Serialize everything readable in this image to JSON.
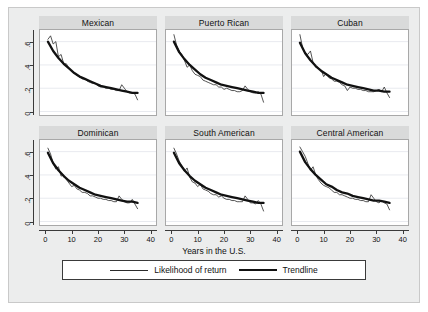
{
  "chart_data": {
    "type": "line",
    "title": "",
    "xlabel": "Years in the U.S.",
    "ylabel": "",
    "xlim": [
      -2,
      42
    ],
    "ylim": [
      -0.03,
      0.7
    ],
    "xticks": [
      "0",
      "10",
      "20",
      "30",
      "40"
    ],
    "xtick_values": [
      0,
      10,
      20,
      30,
      40
    ],
    "yticks": [
      "0",
      ".2",
      ".4",
      ".6"
    ],
    "ytick_values": [
      0,
      0.2,
      0.4,
      0.6
    ],
    "grid": "horizontal",
    "legend_position": "bottom",
    "legend": [
      {
        "name": "Likelihood of return",
        "style": "thin-line"
      },
      {
        "name": "Trendline",
        "style": "thick-line"
      }
    ],
    "layout": {
      "rows": 2,
      "cols": 3
    },
    "panels": [
      {
        "title": "Mexican",
        "row": 0,
        "col": 0,
        "series": [
          {
            "name": "Likelihood of return",
            "style": "thin-line",
            "x": [
              1,
              2,
              3,
              4,
              5,
              6,
              7,
              8,
              9,
              10,
              11,
              12,
              13,
              14,
              15,
              16,
              17,
              18,
              19,
              20,
              21,
              22,
              23,
              24,
              25,
              26,
              27,
              28,
              29,
              30,
              31,
              32,
              33,
              34,
              35
            ],
            "values": [
              0.62,
              0.65,
              0.58,
              0.6,
              0.47,
              0.49,
              0.41,
              0.41,
              0.37,
              0.35,
              0.33,
              0.31,
              0.3,
              0.28,
              0.28,
              0.26,
              0.25,
              0.24,
              0.24,
              0.22,
              0.21,
              0.21,
              0.2,
              0.2,
              0.19,
              0.19,
              0.18,
              0.18,
              0.23,
              0.2,
              0.17,
              0.16,
              0.16,
              0.15,
              0.1
            ]
          },
          {
            "name": "Trendline",
            "style": "thick-line",
            "x": [
              1,
              3,
              5,
              7,
              9,
              11,
              13,
              15,
              17,
              19,
              21,
              23,
              25,
              27,
              29,
              31,
              33,
              35
            ],
            "values": [
              0.6,
              0.52,
              0.46,
              0.41,
              0.37,
              0.33,
              0.3,
              0.28,
              0.26,
              0.24,
              0.22,
              0.21,
              0.2,
              0.19,
              0.18,
              0.17,
              0.16,
              0.16
            ]
          }
        ]
      },
      {
        "title": "Puerto Rican",
        "row": 0,
        "col": 1,
        "series": [
          {
            "name": "Likelihood of return",
            "style": "thin-line",
            "x": [
              1,
              2,
              3,
              4,
              5,
              6,
              7,
              8,
              9,
              10,
              11,
              12,
              13,
              14,
              15,
              16,
              17,
              18,
              19,
              20,
              21,
              22,
              23,
              24,
              25,
              26,
              27,
              28,
              29,
              30,
              31,
              32,
              33,
              34,
              35
            ],
            "values": [
              0.66,
              0.57,
              0.52,
              0.49,
              0.44,
              0.38,
              0.4,
              0.35,
              0.32,
              0.31,
              0.3,
              0.27,
              0.26,
              0.25,
              0.24,
              0.23,
              0.23,
              0.21,
              0.21,
              0.19,
              0.2,
              0.19,
              0.18,
              0.18,
              0.17,
              0.17,
              0.18,
              0.22,
              0.19,
              0.17,
              0.16,
              0.16,
              0.17,
              0.15,
              0.08
            ]
          },
          {
            "name": "Trendline",
            "style": "thick-line",
            "x": [
              1,
              3,
              5,
              7,
              9,
              11,
              13,
              15,
              17,
              19,
              21,
              23,
              25,
              27,
              29,
              31,
              33,
              35
            ],
            "values": [
              0.6,
              0.51,
              0.45,
              0.4,
              0.36,
              0.32,
              0.29,
              0.27,
              0.25,
              0.23,
              0.22,
              0.21,
              0.2,
              0.19,
              0.18,
              0.17,
              0.16,
              0.16
            ]
          }
        ]
      },
      {
        "title": "Cuban",
        "row": 0,
        "col": 2,
        "series": [
          {
            "name": "Likelihood of return",
            "style": "thin-line",
            "x": [
              1,
              2,
              3,
              4,
              5,
              6,
              7,
              8,
              9,
              10,
              11,
              12,
              13,
              14,
              15,
              16,
              17,
              18,
              19,
              20,
              21,
              22,
              23,
              24,
              25,
              26,
              27,
              28,
              29,
              30,
              31,
              32,
              33,
              34,
              35
            ],
            "values": [
              0.66,
              0.55,
              0.5,
              0.49,
              0.52,
              0.42,
              0.38,
              0.37,
              0.36,
              0.3,
              0.33,
              0.29,
              0.28,
              0.26,
              0.26,
              0.25,
              0.23,
              0.22,
              0.18,
              0.21,
              0.2,
              0.2,
              0.19,
              0.19,
              0.18,
              0.18,
              0.17,
              0.17,
              0.17,
              0.18,
              0.19,
              0.17,
              0.21,
              0.16,
              0.12
            ]
          },
          {
            "name": "Trendline",
            "style": "thick-line",
            "x": [
              1,
              3,
              5,
              7,
              9,
              11,
              13,
              15,
              17,
              19,
              21,
              23,
              25,
              27,
              29,
              31,
              33,
              35
            ],
            "values": [
              0.59,
              0.5,
              0.44,
              0.39,
              0.35,
              0.32,
              0.29,
              0.27,
              0.25,
              0.23,
              0.22,
              0.21,
              0.2,
              0.19,
              0.18,
              0.18,
              0.17,
              0.17
            ]
          }
        ]
      },
      {
        "title": "Dominican",
        "row": 1,
        "col": 0,
        "series": [
          {
            "name": "Likelihood of return",
            "style": "thin-line",
            "x": [
              1,
              2,
              3,
              4,
              5,
              6,
              7,
              8,
              9,
              10,
              11,
              12,
              13,
              14,
              15,
              16,
              17,
              18,
              19,
              20,
              21,
              22,
              23,
              24,
              25,
              26,
              27,
              28,
              29,
              30,
              31,
              32,
              33,
              34,
              35
            ],
            "values": [
              0.63,
              0.58,
              0.5,
              0.45,
              0.47,
              0.39,
              0.4,
              0.36,
              0.33,
              0.3,
              0.31,
              0.28,
              0.27,
              0.25,
              0.25,
              0.24,
              0.22,
              0.22,
              0.21,
              0.2,
              0.2,
              0.19,
              0.19,
              0.18,
              0.18,
              0.17,
              0.17,
              0.22,
              0.19,
              0.17,
              0.16,
              0.16,
              0.19,
              0.15,
              0.11
            ]
          },
          {
            "name": "Trendline",
            "style": "thick-line",
            "x": [
              1,
              3,
              5,
              7,
              9,
              11,
              13,
              15,
              17,
              19,
              21,
              23,
              25,
              27,
              29,
              31,
              33,
              35
            ],
            "values": [
              0.59,
              0.5,
              0.44,
              0.39,
              0.35,
              0.32,
              0.29,
              0.27,
              0.25,
              0.23,
              0.22,
              0.21,
              0.2,
              0.19,
              0.18,
              0.17,
              0.17,
              0.16
            ]
          }
        ]
      },
      {
        "title": "South American",
        "row": 1,
        "col": 1,
        "series": [
          {
            "name": "Likelihood of return",
            "style": "thin-line",
            "x": [
              1,
              2,
              3,
              4,
              5,
              6,
              7,
              8,
              9,
              10,
              11,
              12,
              13,
              14,
              15,
              16,
              17,
              18,
              19,
              20,
              21,
              22,
              23,
              24,
              25,
              26,
              27,
              28,
              29,
              30,
              31,
              32,
              33,
              34,
              35
            ],
            "values": [
              0.63,
              0.58,
              0.52,
              0.48,
              0.43,
              0.46,
              0.38,
              0.34,
              0.33,
              0.3,
              0.32,
              0.28,
              0.27,
              0.26,
              0.24,
              0.23,
              0.23,
              0.21,
              0.22,
              0.2,
              0.19,
              0.19,
              0.18,
              0.18,
              0.17,
              0.17,
              0.17,
              0.22,
              0.19,
              0.16,
              0.16,
              0.15,
              0.18,
              0.15,
              0.09
            ]
          },
          {
            "name": "Trendline",
            "style": "thick-line",
            "x": [
              1,
              3,
              5,
              7,
              9,
              11,
              13,
              15,
              17,
              19,
              21,
              23,
              25,
              27,
              29,
              31,
              33,
              35
            ],
            "values": [
              0.59,
              0.5,
              0.44,
              0.39,
              0.35,
              0.32,
              0.29,
              0.27,
              0.25,
              0.23,
              0.22,
              0.21,
              0.2,
              0.19,
              0.18,
              0.17,
              0.16,
              0.16
            ]
          }
        ]
      },
      {
        "title": "Central American",
        "row": 1,
        "col": 2,
        "series": [
          {
            "name": "Likelihood of return",
            "style": "thin-line",
            "x": [
              1,
              2,
              3,
              4,
              5,
              6,
              7,
              8,
              9,
              10,
              11,
              12,
              13,
              14,
              15,
              16,
              17,
              18,
              19,
              20,
              21,
              22,
              23,
              24,
              25,
              26,
              27,
              28,
              29,
              30,
              31,
              32,
              33,
              34,
              35
            ],
            "values": [
              0.64,
              0.6,
              0.56,
              0.5,
              0.44,
              0.47,
              0.4,
              0.36,
              0.33,
              0.31,
              0.3,
              0.29,
              0.27,
              0.25,
              0.25,
              0.23,
              0.23,
              0.22,
              0.21,
              0.2,
              0.2,
              0.19,
              0.19,
              0.18,
              0.18,
              0.17,
              0.17,
              0.23,
              0.2,
              0.17,
              0.16,
              0.18,
              0.16,
              0.15,
              0.1
            ]
          },
          {
            "name": "Trendline",
            "style": "thick-line",
            "x": [
              1,
              3,
              5,
              7,
              9,
              11,
              13,
              15,
              17,
              19,
              21,
              23,
              25,
              27,
              29,
              31,
              33,
              35
            ],
            "values": [
              0.6,
              0.51,
              0.45,
              0.4,
              0.36,
              0.32,
              0.3,
              0.27,
              0.25,
              0.24,
              0.22,
              0.21,
              0.2,
              0.19,
              0.18,
              0.18,
              0.17,
              0.16
            ]
          }
        ]
      }
    ]
  },
  "colors": {
    "figure_background": "#eceded",
    "panel_background": "#ffffff",
    "title_strip": "#d9dada",
    "thin_line": "#2a2a2a",
    "thick_line": "#111111",
    "gridline": "#e8eaef",
    "axis": "#3a3a3a"
  }
}
